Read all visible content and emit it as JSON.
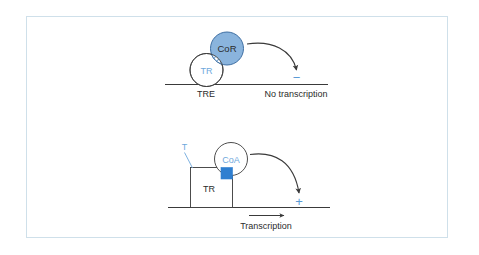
{
  "figure": {
    "type": "biology-mechanism-diagram",
    "title_visible": false,
    "frame_color": "#cfe0ea",
    "background": "#ffffff"
  },
  "colors": {
    "cor_fill": "#8ab4dd",
    "cor_stroke": "#3f6fa3",
    "blue_square": "#2f7fd0",
    "blue_label": "#6fa8dc",
    "sign_blue": "#5b9bd5",
    "line_dark": "#3a3a3a",
    "frame": "#cfe0ea"
  },
  "panels": [
    {
      "id": "top-panel",
      "name": "unliganded-repression",
      "elements": {
        "corepressor_circle": {
          "label": "CoR",
          "fill": "#8ab4dd",
          "stroke": "#3f6fa3"
        },
        "receptor_circle": {
          "label": "TR",
          "fill": "#ffffff",
          "label_color": "#6fa8dc"
        },
        "overlap_region": {
          "name": "hatched-overlap",
          "pattern": "diagonal-stripes",
          "color": "#4a8fd0"
        },
        "dna_label": "TRE",
        "outcome_label": "No transcription",
        "sign": "−",
        "sign_color": "#5b9bd5",
        "arrow": "curved-down-arrow"
      }
    },
    {
      "id": "bottom-panel",
      "name": "liganded-activation",
      "elements": {
        "coactivator_circle": {
          "label": "CoA",
          "fill": "#ffffff",
          "label_color": "#6fa8dc"
        },
        "receptor_box": {
          "label": "TR",
          "fill": "#ffffff",
          "stroke": "#3a3a3a"
        },
        "ligand_square": {
          "name": "thyroid-hormone-ligand",
          "color": "#2f7fd0"
        },
        "ligand_label": "T",
        "ligand_label_color": "#6fa8dc",
        "outcome_label": "Transcription",
        "sign": "+",
        "sign_color": "#5b9bd5",
        "arrow": "curved-down-arrow",
        "transcription_arrow": "rightward-arrow"
      }
    }
  ]
}
